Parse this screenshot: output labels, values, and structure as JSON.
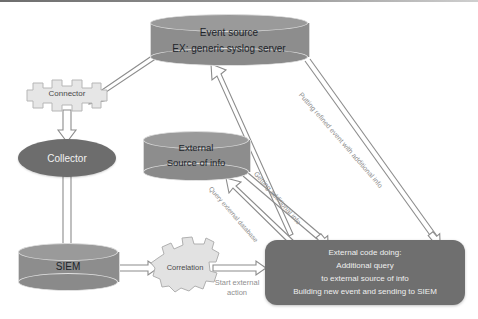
{
  "diagram": {
    "background": "#ffffff",
    "nodes": {
      "event_source": {
        "line1": "Event  source",
        "line2": "EX:  generic syslog server",
        "shape": "cylinder",
        "fill": "#8d8d8d"
      },
      "connector": {
        "label": "Connector",
        "shape": "gear",
        "fill": "#e4e4e4"
      },
      "collector": {
        "label": "Collector",
        "shape": "ellipse",
        "fill": "#6d6d6d"
      },
      "siem": {
        "label": "SIEM",
        "shape": "cylinder",
        "fill": "#8d8d8d"
      },
      "external_source": {
        "line1": "External",
        "line2": "Source of info",
        "shape": "cylinder",
        "fill": "#8d8d8d"
      },
      "correlation": {
        "label": "Correlation",
        "shape": "gear",
        "fill": "#e0e0e0"
      },
      "external_code": {
        "shape": "rounded-rect",
        "fill": "#6f6f6f",
        "lines": [
          "External code  doing:",
          "Additional  query",
          "to external source of info",
          "Building new event and sending  to SIEM"
        ]
      }
    },
    "edge_labels": {
      "putting_refined": "Putting refined event with additional info",
      "getting_additional": "Getting  additional info",
      "query_external": "Query external database",
      "start_external": "Start external\naction",
      "start_external_l1": "Start external",
      "start_external_l2": "action"
    },
    "colors": {
      "arrow_stroke": "#8c8c8c",
      "arrow_fill": "#ffffff",
      "text_dark": "#20242a",
      "text_light": "#efefef",
      "label_gray": "#8d8d8d"
    }
  }
}
